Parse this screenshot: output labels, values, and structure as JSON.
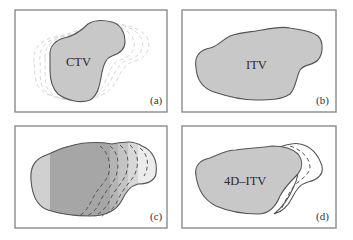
{
  "figure": {
    "panels": [
      {
        "id": "a",
        "tag": "(a)",
        "label": "CTV",
        "description": "Single-phase clinical target volume with faint dashed outlines of other respiratory phases"
      },
      {
        "id": "b",
        "tag": "(b)",
        "label": "ITV",
        "description": "Internal target volume enclosing all motion"
      },
      {
        "id": "c",
        "tag": "(c)",
        "label": "",
        "description": "Overlaid phase contours shown as dashed lines with graded shading"
      },
      {
        "id": "d",
        "tag": "(d)",
        "label": "4D–ITV",
        "description": "4D internal target volume with residual dashed phase contours"
      }
    ]
  },
  "colors": {
    "frame": "#8a8a8a",
    "fill_gray": "#c8c8c8",
    "fill_dark": "#a9a9a9",
    "fill_light": "#dedede",
    "fill_lighter": "#ececec",
    "outline": "#555555",
    "ghost": "#d8d8d8"
  }
}
